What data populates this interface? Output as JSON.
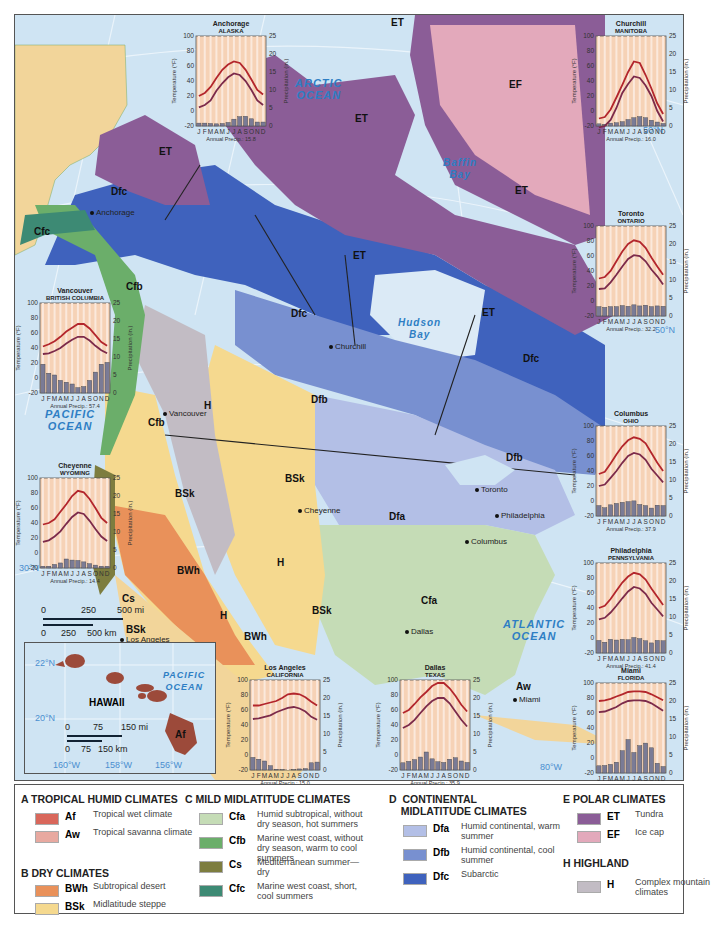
{
  "map": {
    "oceans": [
      {
        "id": "arctic",
        "label": "ARCTIC\nOCEAN"
      },
      {
        "id": "pacific",
        "label": "PACIFIC\nOCEAN"
      },
      {
        "id": "atlantic",
        "label": "ATLANTIC\nOCEAN"
      },
      {
        "id": "baffin",
        "label": "Baffin\nBay"
      },
      {
        "id": "hudson",
        "label": "Hudson\nBay"
      }
    ],
    "region_labels": [
      "ET",
      "ET",
      "ET",
      "ET",
      "ET",
      "ET",
      "EF",
      "Dfc",
      "Dfc",
      "Dfc",
      "Cfc",
      "Cfb",
      "Cfb",
      "H",
      "H",
      "H",
      "BSk",
      "BSk",
      "BSk",
      "BWh",
      "BWh",
      "Cs",
      "BSk",
      "Dfb",
      "Dfb",
      "Dfa",
      "Cfa",
      "Aw"
    ],
    "cities": [
      "Anchorage",
      "Churchill",
      "Vancouver",
      "Cheyenne",
      "Los Angeles",
      "Toronto",
      "Columbus",
      "Philadelphia",
      "Dallas",
      "Miami"
    ],
    "latlon": [
      "30°N",
      "50°N",
      "50°N",
      "80°W",
      "60°N"
    ],
    "scale": {
      "mi": [
        "0",
        "250",
        "500 mi"
      ],
      "km": [
        "0",
        "250",
        "500 km"
      ]
    },
    "hawaii": {
      "title": "HAWAII",
      "ocean": "PACIFIC\nOCEAN",
      "code": "Af",
      "lat": [
        "22°N",
        "20°N"
      ],
      "lon": [
        "160°W",
        "158°W",
        "156°W"
      ],
      "scale": {
        "mi": [
          "0",
          "75",
          "150 mi"
        ],
        "km": [
          "0",
          "75",
          "150 km"
        ]
      }
    }
  },
  "chart_common": {
    "months": [
      "J",
      "F",
      "M",
      "A",
      "M",
      "J",
      "J",
      "A",
      "S",
      "O",
      "N",
      "D"
    ],
    "temp_axis": {
      "label": "Temperature (°F)",
      "ticks": [
        100,
        80,
        60,
        40,
        20,
        0,
        -20
      ],
      "range": [
        -20,
        100
      ]
    },
    "precip_axis": {
      "label": "Precipitation (in.)",
      "ticks": [
        25,
        20,
        15,
        10,
        5,
        0
      ],
      "range": [
        0,
        25
      ]
    },
    "annual_prefix": "Annual Precip.: "
  },
  "chart_data": [
    {
      "type": "line",
      "city": "Anchorage",
      "region": "ALASKA",
      "annual_precip": "15.8",
      "high": [
        20,
        24,
        32,
        44,
        55,
        62,
        66,
        64,
        55,
        42,
        28,
        22
      ],
      "low": [
        5,
        8,
        14,
        27,
        37,
        45,
        50,
        48,
        40,
        28,
        14,
        8
      ],
      "precip": [
        0.8,
        0.8,
        0.7,
        0.6,
        0.7,
        1.0,
        1.9,
        2.6,
        2.7,
        2.0,
        1.1,
        1.1
      ]
    },
    {
      "type": "line",
      "city": "Churchill",
      "region": "MANITOBA",
      "annual_precip": "16.0",
      "high": [
        -10,
        -8,
        2,
        18,
        35,
        52,
        66,
        64,
        48,
        30,
        10,
        -4
      ],
      "low": [
        -22,
        -20,
        -12,
        4,
        24,
        36,
        46,
        44,
        34,
        20,
        0,
        -14
      ],
      "precip": [
        0.6,
        0.5,
        0.8,
        0.9,
        1.2,
        1.8,
        2.3,
        2.6,
        2.3,
        1.6,
        1.1,
        0.7
      ]
    },
    {
      "type": "line",
      "city": "Toronto",
      "region": "ONTARIO",
      "annual_precip": "32.2",
      "high": [
        30,
        32,
        40,
        53,
        66,
        76,
        81,
        79,
        71,
        58,
        46,
        35
      ],
      "low": [
        16,
        17,
        25,
        35,
        46,
        56,
        61,
        60,
        53,
        42,
        33,
        22
      ],
      "precip": [
        2.6,
        2.4,
        2.6,
        2.6,
        2.9,
        2.7,
        3.1,
        2.8,
        3.0,
        2.6,
        2.8,
        2.7
      ]
    },
    {
      "type": "line",
      "city": "Vancouver",
      "region": "BRITISH COLUMBIA",
      "annual_precip": "57.4",
      "high": [
        42,
        45,
        49,
        55,
        62,
        67,
        72,
        72,
        66,
        57,
        48,
        43
      ],
      "low": [
        32,
        33,
        36,
        40,
        46,
        51,
        55,
        55,
        50,
        43,
        37,
        33
      ],
      "precip": [
        8.0,
        5.5,
        5.0,
        3.5,
        3.0,
        2.5,
        1.5,
        1.8,
        3.5,
        5.8,
        8.0,
        8.5
      ]
    },
    {
      "type": "line",
      "city": "Cheyenne",
      "region": "WYOMING",
      "annual_precip": "14.4",
      "high": [
        38,
        40,
        45,
        55,
        65,
        76,
        83,
        81,
        72,
        60,
        47,
        40
      ],
      "low": [
        15,
        17,
        22,
        29,
        39,
        48,
        54,
        52,
        43,
        32,
        22,
        16
      ],
      "precip": [
        0.5,
        0.5,
        1.0,
        1.4,
        2.5,
        2.2,
        2.1,
        1.7,
        1.2,
        0.8,
        0.5,
        0.5
      ]
    },
    {
      "type": "line",
      "city": "Columbus",
      "region": "OHIO",
      "annual_precip": "37.9",
      "high": [
        36,
        39,
        50,
        62,
        73,
        81,
        85,
        83,
        77,
        64,
        51,
        40
      ],
      "low": [
        20,
        22,
        31,
        40,
        51,
        60,
        64,
        62,
        55,
        43,
        34,
        25
      ],
      "precip": [
        2.9,
        2.3,
        3.1,
        3.5,
        3.8,
        4.0,
        4.2,
        3.2,
        2.9,
        2.2,
        3.0,
        2.9
      ]
    },
    {
      "type": "line",
      "city": "Philadelphia",
      "region": "PENNSYLVANIA",
      "annual_precip": "41.4",
      "high": [
        40,
        43,
        52,
        63,
        74,
        82,
        87,
        85,
        78,
        66,
        55,
        44
      ],
      "low": [
        25,
        27,
        34,
        43,
        53,
        62,
        68,
        66,
        59,
        47,
        38,
        29
      ],
      "precip": [
        3.5,
        3.0,
        3.8,
        3.6,
        3.8,
        3.7,
        4.3,
        4.0,
        3.4,
        2.8,
        3.5,
        3.4
      ]
    },
    {
      "type": "line",
      "city": "Miami",
      "region": "FLORIDA",
      "annual_precip": "57.1",
      "high": [
        76,
        77,
        79,
        82,
        85,
        88,
        89,
        89,
        88,
        85,
        81,
        77
      ],
      "low": [
        61,
        62,
        65,
        68,
        73,
        76,
        77,
        77,
        76,
        73,
        68,
        63
      ],
      "precip": [
        2.0,
        2.1,
        2.4,
        3.0,
        6.2,
        9.3,
        5.7,
        7.6,
        8.3,
        7.0,
        2.7,
        1.8
      ]
    },
    {
      "type": "line",
      "city": "Los Angeles",
      "region": "CALIFORNIA",
      "annual_precip": "15.0",
      "high": [
        66,
        66,
        68,
        70,
        72,
        76,
        81,
        82,
        81,
        77,
        71,
        66
      ],
      "low": [
        48,
        49,
        51,
        53,
        57,
        60,
        63,
        64,
        62,
        58,
        51,
        47
      ],
      "precip": [
        3.5,
        3.0,
        2.5,
        1.2,
        0.2,
        0.1,
        0.0,
        0.1,
        0.3,
        0.4,
        2.0,
        2.2
      ]
    },
    {
      "type": "line",
      "city": "Dallas",
      "region": "TEXAS",
      "annual_precip": "35.9",
      "high": [
        56,
        60,
        68,
        77,
        84,
        92,
        96,
        96,
        89,
        79,
        67,
        58
      ],
      "low": [
        36,
        40,
        47,
        56,
        65,
        72,
        76,
        76,
        69,
        58,
        47,
        38
      ],
      "precip": [
        2.0,
        2.4,
        2.9,
        3.6,
        5.0,
        3.1,
        2.3,
        2.1,
        3.0,
        3.4,
        2.5,
        2.1
      ]
    }
  ],
  "legend": {
    "groups": [
      {
        "title": "A  TROPICAL HUMID CLIMATES",
        "items": [
          {
            "code": "Af",
            "desc": "Tropical wet climate",
            "color": "#d9675b"
          },
          {
            "code": "Aw",
            "desc": "Tropical savanna climate",
            "color": "#e8a9a0"
          }
        ]
      },
      {
        "title": "B  DRY CLIMATES",
        "items": [
          {
            "code": "BWh",
            "desc": "Subtropical desert",
            "color": "#e9915a"
          },
          {
            "code": "BSk",
            "desc": "Midlatitude steppe",
            "color": "#f5d98f"
          }
        ]
      },
      {
        "title": "C  MILD MIDLATITUDE CLIMATES",
        "items": [
          {
            "code": "Cfa",
            "desc": "Humid subtropical, without dry season, hot summers",
            "color": "#c5dcb6"
          },
          {
            "code": "Cfb",
            "desc": "Marine west coast, without dry season, warm to cool summers",
            "color": "#6bae6a"
          },
          {
            "code": "Cs",
            "desc": "Mediterranean summer—dry",
            "color": "#7d7d3f"
          },
          {
            "code": "Cfc",
            "desc": "Marine west coast, short, cool summers",
            "color": "#3d8a74"
          }
        ]
      },
      {
        "title": "D  CONTINENTAL\n    MIDLATITUDE CLIMATES",
        "items": [
          {
            "code": "Dfa",
            "desc": "Humid continental, warm summer",
            "color": "#b3bfe6"
          },
          {
            "code": "Dfb",
            "desc": "Humid continental, cool summer",
            "color": "#7890d0"
          },
          {
            "code": "Dfc",
            "desc": "Subarctic",
            "color": "#3f62bd"
          }
        ]
      },
      {
        "title": "E  POLAR CLIMATES",
        "items": [
          {
            "code": "ET",
            "desc": "Tundra",
            "color": "#8b5d97"
          },
          {
            "code": "EF",
            "desc": "Ice cap",
            "color": "#e3a9bb"
          }
        ]
      },
      {
        "title": "H  HIGHLAND",
        "items": [
          {
            "code": "H",
            "desc": "Complex mountain climates",
            "color": "#c2bcc4"
          }
        ]
      }
    ]
  }
}
